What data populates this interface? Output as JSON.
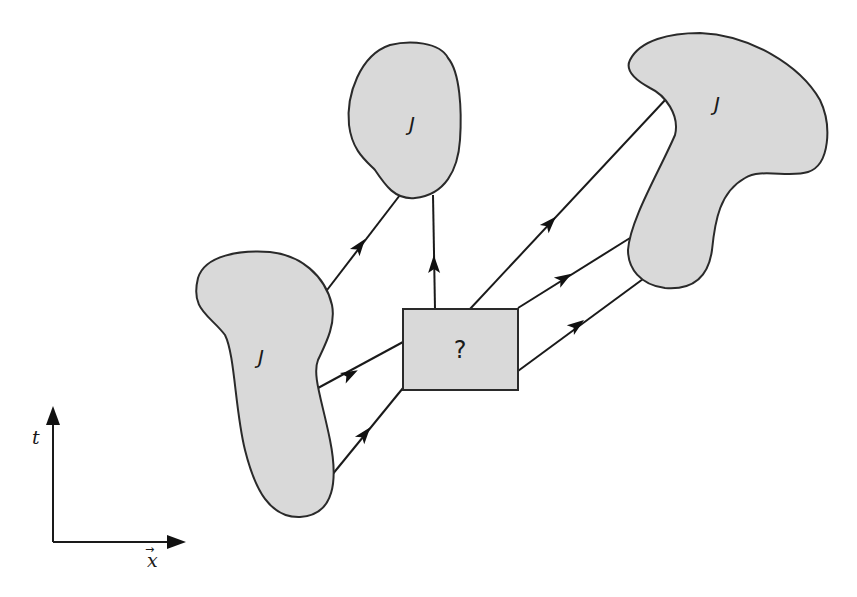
{
  "diagram": {
    "regions": [
      {
        "id": "left",
        "label": "J"
      },
      {
        "id": "top",
        "label": "J"
      },
      {
        "id": "right",
        "label": "J"
      }
    ],
    "center_box": {
      "label": "?"
    },
    "axes": {
      "vertical_label": "t",
      "horizontal_label": "x",
      "horizontal_vector_arrow": "→"
    },
    "colors": {
      "region_fill": "#d9d9d9",
      "stroke": "#2a2a2a",
      "background": "#ffffff"
    },
    "edges": [
      {
        "from": "left",
        "to": "top"
      },
      {
        "from": "center_box",
        "to": "top"
      },
      {
        "from": "left",
        "to": "center_box"
      },
      {
        "from": "left",
        "to": "center_box"
      },
      {
        "from": "center_box",
        "to": "right"
      },
      {
        "from": "center_box",
        "to": "right"
      },
      {
        "from": "center_box",
        "to": "right"
      }
    ]
  }
}
